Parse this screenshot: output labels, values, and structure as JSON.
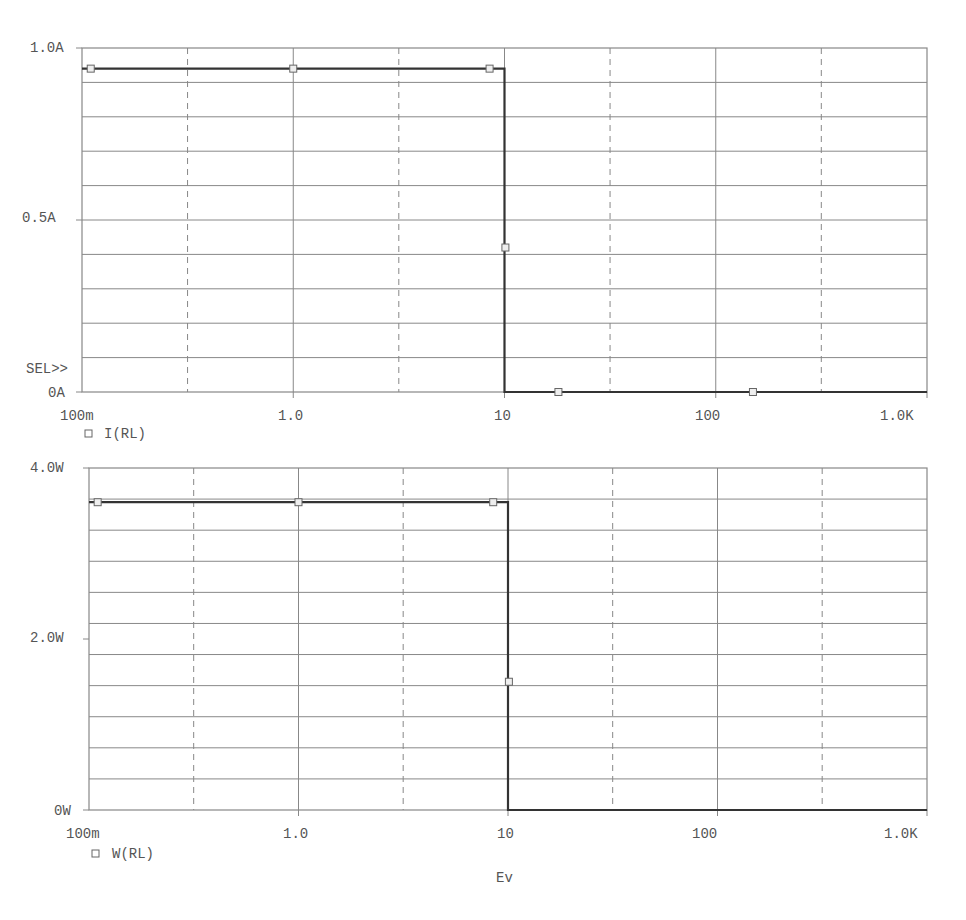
{
  "chart_data": [
    {
      "type": "line",
      "title": "",
      "xlabel": "Ev",
      "ylabel": "",
      "x_scale": "log",
      "xlim": [
        0.1,
        1000
      ],
      "ylim": [
        0,
        1.0
      ],
      "x_ticks": [
        "100m",
        "1.0",
        "10",
        "100",
        "1.0K"
      ],
      "y_ticks": [
        "0A",
        "0.5A",
        "1.0A"
      ],
      "grid": true,
      "selection_marker": "SEL>>",
      "legend": [
        "I(RL)"
      ],
      "series": [
        {
          "name": "I(RL)",
          "x": [
            0.1,
            1.0,
            8.5,
            10.0,
            10.0,
            18,
            150,
            1000
          ],
          "y": [
            0.94,
            0.94,
            0.94,
            0.94,
            0.0,
            0.0,
            0.0,
            0.0
          ],
          "markers_x": [
            0.11,
            1.0,
            8.5,
            10.1,
            18,
            150
          ],
          "markers_y": [
            0.94,
            0.94,
            0.94,
            0.42,
            0.0,
            0.0
          ]
        }
      ]
    },
    {
      "type": "line",
      "title": "",
      "xlabel": "Ev",
      "ylabel": "",
      "x_scale": "log",
      "xlim": [
        0.1,
        1000
      ],
      "ylim": [
        0,
        4.0
      ],
      "x_ticks": [
        "100m",
        "1.0",
        "10",
        "100",
        "1.0K"
      ],
      "y_ticks": [
        "0W",
        "2.0W",
        "4.0W"
      ],
      "grid": true,
      "legend": [
        "W(RL)"
      ],
      "series": [
        {
          "name": "W(RL)",
          "x": [
            0.1,
            1.0,
            8.5,
            10.0,
            10.0,
            1000
          ],
          "y": [
            3.6,
            3.6,
            3.6,
            3.6,
            0.0,
            0.0
          ],
          "markers_x": [
            0.11,
            1.0,
            8.5,
            10.1
          ],
          "markers_y": [
            3.6,
            3.6,
            3.6,
            1.5
          ]
        }
      ]
    }
  ],
  "plots": [
    {
      "legend_label": "I(RL)",
      "sel_label": "SEL>>",
      "y_labels": [
        "1.0A",
        "0.5A",
        "0A"
      ],
      "x_labels": [
        "100m",
        "1.0",
        "10",
        "100",
        "1.0K"
      ]
    },
    {
      "legend_label": "W(RL)",
      "y_labels": [
        "4.0W",
        "2.0W",
        "0W"
      ],
      "x_labels": [
        "100m",
        "1.0",
        "10",
        "100",
        "1.0K"
      ]
    }
  ],
  "x_axis_label": "Ev",
  "colors": {
    "grid": "#888888",
    "trace": "#333333",
    "text": "#555555"
  }
}
